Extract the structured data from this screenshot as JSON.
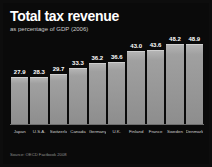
{
  "header": {
    "title": "Total tax revenue",
    "subtitle": "as percentage of GDP (2006)"
  },
  "footer": {
    "source": "Source: OECD Factbook 2008"
  },
  "colors": {
    "background": "#0a0a0a",
    "bar": "#9a9a9a",
    "bar_top_edge": "#cfcfcf",
    "title_text": "#ffffff",
    "subtitle_text": "#c9c9c9",
    "category_text": "#cdcdcd",
    "value_text": "#ffffff",
    "source_text": "#8f8f8f",
    "axis_line": "#6e6e6e"
  },
  "chart_data": {
    "type": "bar",
    "title": "Total tax revenue",
    "subtitle": "as percentage of GDP (2006)",
    "xlabel": "",
    "ylabel": "",
    "ylim": [
      0,
      52
    ],
    "grid": false,
    "legend": false,
    "categories": [
      "Japan",
      "U.S.A.",
      "Switzerland",
      "Canada",
      "Germany",
      "U.K.",
      "Finland",
      "France",
      "Sweden",
      "Denmark"
    ],
    "values": [
      27.9,
      28.3,
      29.7,
      33.3,
      36.2,
      36.6,
      43.0,
      43.6,
      48.2,
      48.9
    ],
    "value_labels": [
      "27.9",
      "28.3",
      "29.7",
      "33.3",
      "36.2",
      "36.6",
      "43.0",
      "43.6",
      "48.2",
      "48.9"
    ],
    "source": "Source: OECD Factbook 2008"
  }
}
